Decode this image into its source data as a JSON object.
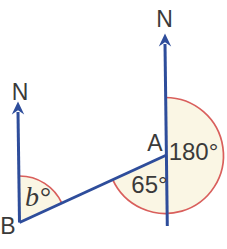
{
  "figure": {
    "type": "geometry-bearings-diagram",
    "labels": {
      "north_at_b": "N",
      "north_at_a": "N",
      "point_a": "A",
      "point_b": "B",
      "angle_reflex_at_a": "180°",
      "angle_at_a": "65°",
      "angle_at_b": "b°"
    },
    "colors": {
      "line_blue": "#2e4d9b",
      "arc_red": "#d95f5c",
      "sector_cream": "#faf6e4",
      "text_gray": "#3a3a3a",
      "background": "#ffffff"
    }
  }
}
